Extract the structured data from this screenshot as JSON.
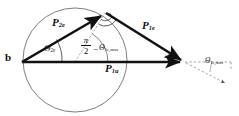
{
  "figure": {
    "type": "vector-geometry-diagram",
    "background": "#ffffff",
    "stroke_color": "#111111",
    "circle_color": "#6b6b6b",
    "dashed_color": "#8a8a8a"
  },
  "labels": {
    "origin_point": "b",
    "vector_p2e_base": "P",
    "vector_p2e_sub": "2e",
    "vector_p1e_base": "P",
    "vector_p1e_sub": "1e",
    "vector_p1u_base": "P",
    "vector_p1u_sub": "1u",
    "angle_theta2e_base": "Θ",
    "angle_theta2e_sub": "2e",
    "angle_theta1emax_base": "Θ",
    "angle_theta1emax_sub": "1e,max",
    "fraction_numerator": "π",
    "fraction_denominator": "2",
    "minus_sign": "−",
    "angle_theta1emax_right_base": "Θ",
    "angle_theta1emax_right_sub": "1e,max"
  },
  "geometry": {
    "circle": {
      "cx": 75,
      "cy": 60,
      "r": 52
    },
    "origin": {
      "x": 22,
      "y": 62
    },
    "apex": {
      "x": 105,
      "y": 13
    },
    "tip": {
      "x": 186,
      "y": 62
    },
    "baseline": {
      "x1": 22,
      "y1": 62,
      "x2": 186,
      "y2": 62
    },
    "dashed_extension": {
      "x1": 186,
      "y1": 62,
      "x2": 232,
      "y2": 62
    },
    "dashed_diagonal": {
      "x1": 186,
      "y1": 62,
      "x2": 228,
      "y2": 85
    },
    "dashed_radius": {
      "x1": 75,
      "y1": 62,
      "x2": 105,
      "y2": 13
    }
  },
  "markers": {
    "right_angle_marker": "right-angle-dot",
    "arc_theta2e": "angle-arc",
    "arc_apex": "angle-arc",
    "arc_right": "angle-arc"
  }
}
